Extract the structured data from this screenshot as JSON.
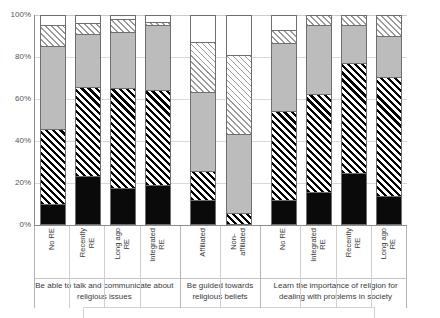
{
  "chart_data": {
    "type": "bar",
    "subtype": "stacked-percentage-column",
    "title": "",
    "xlabel": "",
    "ylabel": "",
    "ylim": [
      0,
      100
    ],
    "yticks": [
      "0%",
      "20%",
      "40%",
      "60%",
      "80%",
      "100%"
    ],
    "ytick_values": [
      0,
      20,
      40,
      60,
      80,
      100
    ],
    "grid": true,
    "legend": "cut off below plot",
    "stack_order_bottom_to_top": [
      "black",
      "dark-hatch",
      "gray",
      "light-hatch",
      "white"
    ],
    "series": [
      {
        "name": "black",
        "values": [
          9,
          22.5,
          17,
          18.5,
          11,
          0,
          11,
          15,
          24,
          13
        ]
      },
      {
        "name": "dark-hatch",
        "values": [
          36,
          43,
          48,
          45.5,
          14,
          5,
          43,
          47,
          53,
          57
        ]
      },
      {
        "name": "gray",
        "values": [
          40,
          25.5,
          27,
          31,
          38,
          38,
          32.5,
          33,
          18,
          20
        ]
      },
      {
        "name": "light-hatch",
        "values": [
          10,
          5,
          6,
          1.5,
          24,
          38,
          6.5,
          5,
          5,
          10
        ]
      },
      {
        "name": "white",
        "values": [
          5,
          4,
          2,
          3.5,
          13,
          19,
          7,
          0,
          0,
          0
        ]
      }
    ],
    "categories": [
      "No RE",
      "Recently RE",
      "Long ago RE",
      "Integrated RE",
      "Affiliated",
      "Non-affiliated",
      "No RE",
      "Integrated RE",
      "Recently RE",
      "Long ago RE"
    ],
    "category_labels_wrapped": [
      "No RE",
      "Recently\nRE",
      "Long ago\nRE",
      "Integrated\nRE",
      "Affiliated",
      "Non-\naffiliated",
      "No RE",
      "Integrated\nRE",
      "Recently\nRE",
      "Long ago\nRE"
    ],
    "groups": [
      {
        "label": "Be able to talk and communicate about religious issues",
        "categories": 4
      },
      {
        "label": "Be guided towards religious beliefs",
        "categories": 2
      },
      {
        "label": "Learn the importance of religion for dealing with problems in society",
        "categories": 4
      }
    ],
    "colors": {
      "black": "#0a0a0a",
      "gray": "#bcbcbc",
      "white": "#ffffff",
      "hatch_line": "#000000",
      "light_hatch_line": "#9a9a9a",
      "axis": "#8c8c8c",
      "gridline": "#d9d9d9",
      "text": "#3a3a3a"
    }
  }
}
